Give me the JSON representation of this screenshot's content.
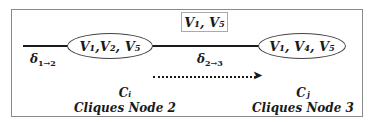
{
  "diagram": {
    "separator": "V1, V5",
    "separator_display": "V₁, V₅",
    "clique_i": {
      "variables_display": "V₁,V₂, V₅",
      "symbol": "Cᵢ",
      "caption": "Cliques Node 2"
    },
    "clique_j": {
      "variables_display": "V₁, V₄, V₅",
      "symbol": "Cⱼ",
      "caption": "Cliques Node 3"
    },
    "messages": {
      "incoming": {
        "symbol": "δ",
        "subscript": "1→2"
      },
      "outgoing": {
        "symbol": "δ",
        "subscript": "2→3"
      }
    },
    "arrow_style": "dotted"
  }
}
